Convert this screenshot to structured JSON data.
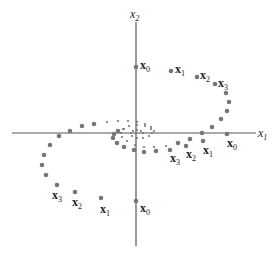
{
  "diagram": {
    "type": "phase-plane-trajectories",
    "axes": {
      "x_label": {
        "base": "x",
        "sub": "1"
      },
      "y_label": {
        "base": "x",
        "sub": "2"
      },
      "origin": [
        136,
        133
      ],
      "x_range_px": [
        12,
        256
      ],
      "y_range_px": [
        22,
        246
      ]
    },
    "colors": {
      "axis": "#555555",
      "point": "#777777",
      "text": "#222222"
    },
    "trajectory_a": {
      "points": [
        [
          136,
          67
        ],
        [
          171,
          71
        ],
        [
          197,
          77
        ],
        [
          215,
          84
        ],
        [
          226,
          93
        ],
        [
          229,
          102
        ],
        [
          227,
          111
        ],
        [
          221,
          119
        ],
        [
          212,
          127
        ],
        [
          202,
          133
        ],
        [
          190,
          139
        ],
        [
          178,
          143
        ],
        [
          166,
          146
        ],
        [
          154,
          147
        ],
        [
          144,
          147
        ],
        [
          135,
          145
        ],
        [
          127,
          141
        ],
        [
          122,
          137
        ],
        [
          121,
          133
        ],
        [
          123,
          129
        ],
        [
          129,
          126
        ],
        [
          137,
          125
        ],
        [
          145,
          126
        ],
        [
          151,
          129
        ],
        [
          152,
          133
        ],
        [
          149,
          136
        ],
        [
          143,
          138
        ],
        [
          137,
          138
        ],
        [
          132,
          136
        ],
        [
          131,
          133
        ],
        [
          133,
          131
        ],
        [
          137,
          130
        ],
        [
          141,
          131
        ],
        [
          143,
          133
        ]
      ],
      "labels": [
        {
          "base": "x",
          "sub": "0",
          "x": 140,
          "y": 59
        },
        {
          "base": "x",
          "sub": "1",
          "x": 175,
          "y": 63
        },
        {
          "base": "x",
          "sub": "2",
          "x": 200,
          "y": 69
        },
        {
          "base": "x",
          "sub": "3",
          "x": 218,
          "y": 77
        }
      ]
    },
    "trajectory_b": {
      "points": [
        [
          227,
          134
        ],
        [
          203,
          141
        ],
        [
          186,
          146
        ],
        [
          170,
          150
        ],
        [
          156,
          151
        ],
        [
          144,
          152
        ],
        [
          134,
          150
        ],
        [
          124,
          147
        ],
        [
          117,
          143
        ],
        [
          113,
          138
        ],
        [
          114,
          134
        ],
        [
          118,
          131
        ],
        [
          124,
          129
        ]
      ],
      "labels": [
        {
          "base": "x",
          "sub": "0",
          "x": 227,
          "y": 137
        },
        {
          "base": "x",
          "sub": "1",
          "x": 203,
          "y": 144
        },
        {
          "base": "x",
          "sub": "2",
          "x": 186,
          "y": 148
        },
        {
          "base": "x",
          "sub": "3",
          "x": 170,
          "y": 152
        }
      ]
    },
    "trajectory_c": {
      "points": [
        [
          136,
          201
        ],
        [
          101,
          198
        ],
        [
          75,
          192
        ],
        [
          57,
          185
        ],
        [
          46,
          175
        ],
        [
          42,
          165
        ],
        [
          44,
          155
        ],
        [
          50,
          145
        ],
        [
          59,
          136
        ],
        [
          70,
          131
        ],
        [
          82,
          126
        ],
        [
          94,
          124
        ],
        [
          107,
          122
        ],
        [
          118,
          121
        ],
        [
          128,
          121
        ],
        [
          137,
          122
        ],
        [
          145,
          124
        ],
        [
          151,
          127
        ],
        [
          154,
          131
        ]
      ],
      "labels": [
        {
          "base": "x",
          "sub": "0",
          "x": 140,
          "y": 202
        },
        {
          "base": "x",
          "sub": "1",
          "x": 100,
          "y": 203
        },
        {
          "base": "x",
          "sub": "2",
          "x": 72,
          "y": 196
        },
        {
          "base": "x",
          "sub": "3",
          "x": 52,
          "y": 189
        }
      ]
    }
  }
}
